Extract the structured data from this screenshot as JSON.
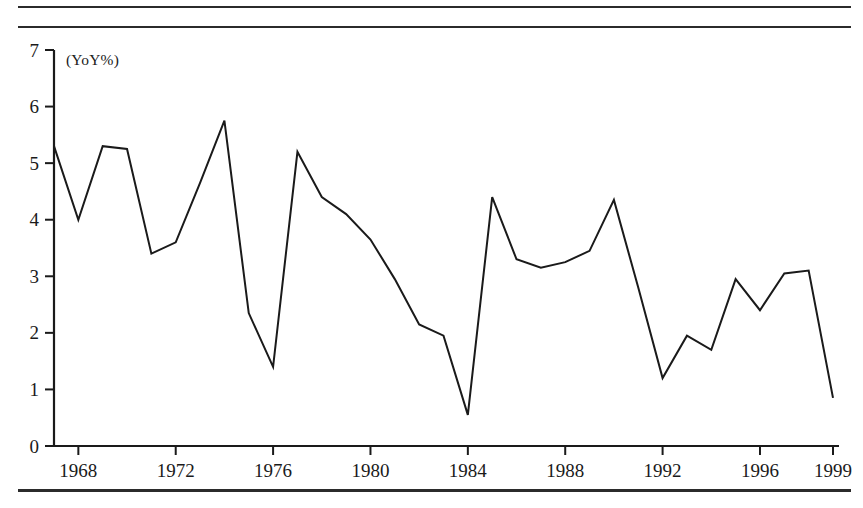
{
  "chart_data": {
    "type": "line",
    "title": "",
    "subtitle": "",
    "unit_label": "(YoY%)",
    "xlabel": "",
    "ylabel": "",
    "xlim": [
      1967,
      1999
    ],
    "ylim": [
      0,
      7
    ],
    "ytick_values": [
      0,
      1,
      2,
      3,
      4,
      5,
      6,
      7
    ],
    "ytick_labels": [
      "0",
      "1",
      "2",
      "3",
      "4",
      "5",
      "6",
      "7"
    ],
    "xtick_values": [
      1968,
      1972,
      1976,
      1980,
      1984,
      1988,
      1992,
      1996,
      1999
    ],
    "xtick_labels": [
      "1968",
      "1972",
      "1976",
      "1980",
      "1984",
      "1988",
      "1992",
      "1996",
      "1999"
    ],
    "grid": false,
    "legend": false,
    "legend_position": "none",
    "line_color": "#1a1a1a",
    "line_width": 2.0,
    "x": [
      1967,
      1968,
      1969,
      1970,
      1971,
      1972,
      1973,
      1974,
      1975,
      1976,
      1977,
      1978,
      1979,
      1980,
      1981,
      1982,
      1983,
      1984,
      1985,
      1986,
      1987,
      1988,
      1989,
      1990,
      1991,
      1992,
      1993,
      1994,
      1995,
      1996,
      1997,
      1998,
      1999
    ],
    "series": [
      {
        "name": "YoY%",
        "values": [
          5.3,
          4.0,
          5.3,
          5.25,
          3.4,
          3.6,
          4.65,
          5.75,
          2.35,
          1.4,
          5.2,
          4.4,
          4.1,
          3.65,
          2.95,
          2.15,
          1.95,
          0.55,
          4.4,
          3.3,
          3.15,
          3.25,
          3.45,
          4.35,
          2.8,
          1.2,
          1.95,
          1.7,
          2.95,
          2.4,
          3.05,
          3.1,
          0.85
        ]
      }
    ]
  },
  "notes": {
    "source": ""
  }
}
